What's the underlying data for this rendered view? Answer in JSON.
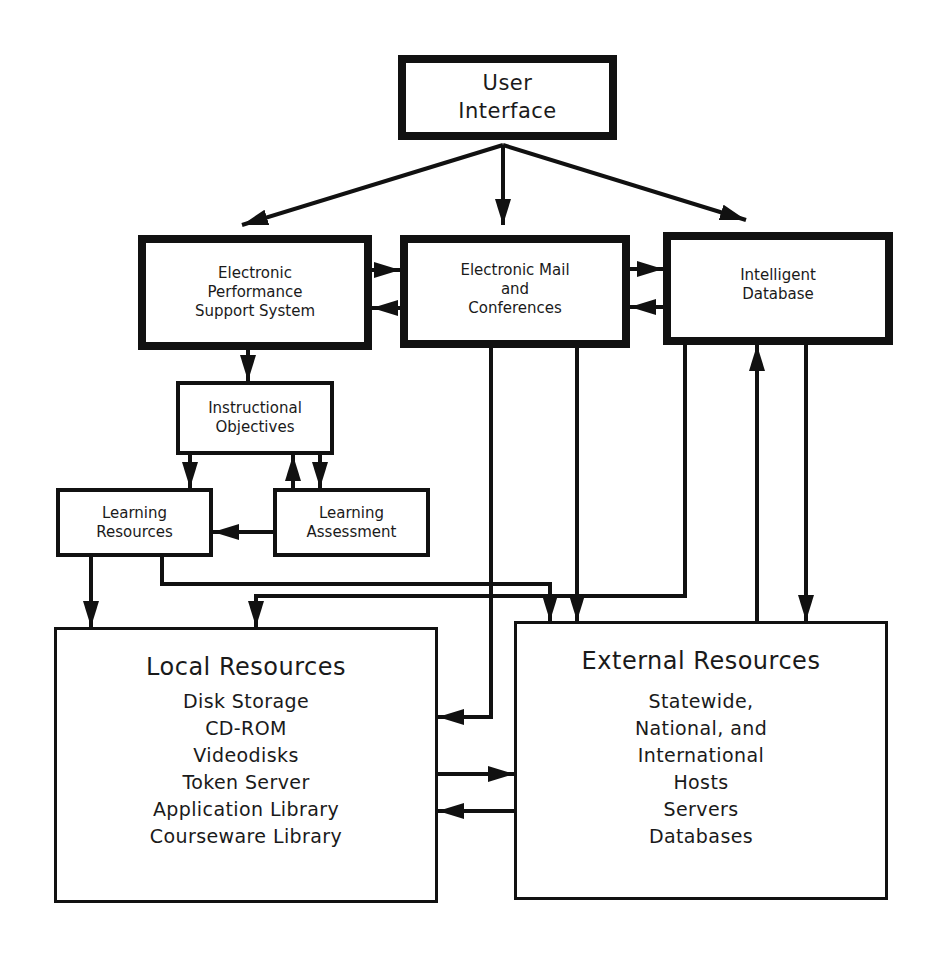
{
  "diagram": {
    "nodes": {
      "user_interface": {
        "lines": [
          "User",
          "Interface"
        ]
      },
      "epss": {
        "lines": [
          "Electronic",
          "Performance",
          "Support System"
        ]
      },
      "email": {
        "lines": [
          "Electronic Mail",
          "and",
          "Conferences"
        ]
      },
      "intelligent_db": {
        "lines": [
          "Intelligent",
          "Database"
        ]
      },
      "instructional_objectives": {
        "lines": [
          "Instructional",
          "Objectives"
        ]
      },
      "learning_resources": {
        "lines": [
          "Learning",
          "Resources"
        ]
      },
      "learning_assessment": {
        "lines": [
          "Learning",
          "Assessment"
        ]
      },
      "local_resources": {
        "title": "Local Resources",
        "items": [
          "Disk Storage",
          "CD-ROM",
          "Videodisks",
          "Token Server",
          "Application Library",
          "Courseware Library"
        ]
      },
      "external_resources": {
        "title": "External Resources",
        "items": [
          "Statewide,",
          "National, and",
          "International",
          "Hosts",
          "Servers",
          "Databases"
        ]
      }
    },
    "edges": [
      {
        "from": "User Interface",
        "to": "Electronic Performance Support System"
      },
      {
        "from": "User Interface",
        "to": "Electronic Mail and Conferences"
      },
      {
        "from": "User Interface",
        "to": "Intelligent Database"
      },
      {
        "from": "Electronic Performance Support System",
        "to": "Electronic Mail and Conferences"
      },
      {
        "from": "Electronic Mail and Conferences",
        "to": "Electronic Performance Support System"
      },
      {
        "from": "Electronic Mail and Conferences",
        "to": "Intelligent Database"
      },
      {
        "from": "Intelligent Database",
        "to": "Electronic Mail and Conferences"
      },
      {
        "from": "Electronic Performance Support System",
        "to": "Instructional Objectives"
      },
      {
        "from": "Instructional Objectives",
        "to": "Learning Resources"
      },
      {
        "from": "Instructional Objectives",
        "to": "Learning Assessment"
      },
      {
        "from": "Learning Assessment",
        "to": "Instructional Objectives"
      },
      {
        "from": "Learning Assessment",
        "to": "Learning Resources"
      },
      {
        "from": "Learning Resources",
        "to": "Local Resources"
      },
      {
        "from": "Learning Resources",
        "to": "External Resources"
      },
      {
        "from": "Intelligent Database",
        "to": "Local Resources"
      },
      {
        "from": "Electronic Mail and Conferences",
        "to": "Local Resources"
      },
      {
        "from": "Electronic Mail and Conferences",
        "to": "External Resources"
      },
      {
        "from": "External Resources",
        "to": "Intelligent Database"
      },
      {
        "from": "Intelligent Database",
        "to": "External Resources"
      },
      {
        "from": "Local Resources",
        "to": "External Resources"
      },
      {
        "from": "External Resources",
        "to": "Local Resources"
      }
    ]
  }
}
